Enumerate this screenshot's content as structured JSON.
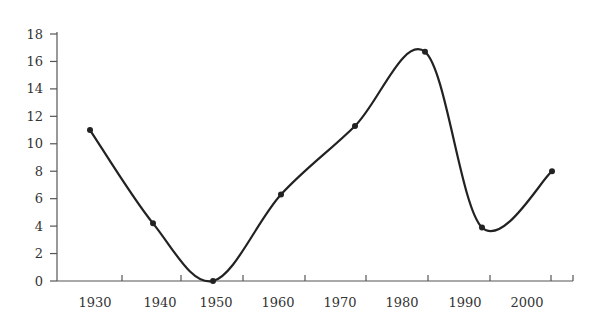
{
  "chart_data": {
    "type": "line",
    "title": "",
    "xlabel": "",
    "ylabel": "",
    "categories": [
      "1930",
      "1940",
      "1950",
      "1960",
      "1970",
      "1980",
      "1990",
      "2000"
    ],
    "series": [
      {
        "name": "",
        "values": [
          11,
          4.2,
          0,
          6.3,
          11.3,
          16.7,
          3.9,
          8
        ]
      }
    ],
    "smoothed": true,
    "markers": true,
    "ylim": [
      0,
      18
    ],
    "yticks": [
      "0",
      "2",
      "4",
      "6",
      "8",
      "10",
      "12",
      "14",
      "16",
      "18"
    ],
    "xticks": [
      "1930",
      "1940",
      "1950",
      "1960",
      "1970",
      "1980",
      "1990",
      "2000"
    ],
    "grid": false,
    "legend": null,
    "colors": {
      "line": "#222222",
      "axis": "#555555",
      "text": "#333333"
    }
  }
}
